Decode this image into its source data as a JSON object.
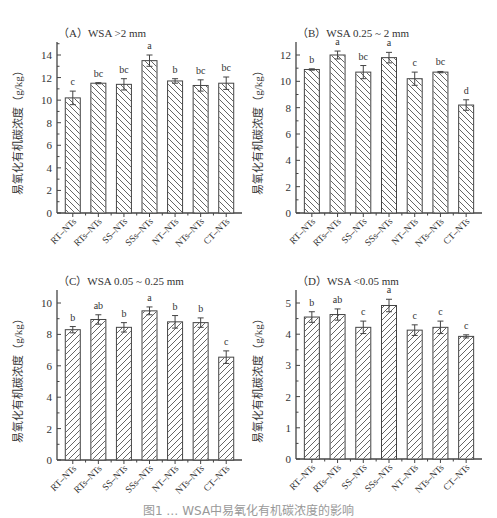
{
  "figure": {
    "caption": "图1 … WSA中易氧化有机碳浓度的影响"
  },
  "hatch_color": "#555555",
  "axis_color": "#444444",
  "chart_data": [
    {
      "id": "A",
      "type": "bar",
      "title": "（A）WSA >2 mm",
      "xlabel": "",
      "ylabel": "易氧化有机碳浓度（g/kg）",
      "categories": [
        "RT–NTs",
        "RTs–NTs",
        "SS–NTs",
        "SSs–NTs",
        "NT–NTs",
        "NTs–NTs",
        "CT–NTs"
      ],
      "values": [
        10.2,
        11.5,
        11.4,
        13.5,
        11.7,
        11.3,
        11.5
      ],
      "errors": [
        0.6,
        0.05,
        0.5,
        0.5,
        0.2,
        0.5,
        0.55
      ],
      "letters": [
        "c",
        "bc",
        "bc",
        "a",
        "b",
        "bc",
        "bc"
      ],
      "yticks": [
        0,
        2,
        4,
        6,
        8,
        10,
        12,
        14
      ],
      "ylim": [
        0,
        15
      ],
      "grid": false,
      "legend": null
    },
    {
      "id": "B",
      "type": "bar",
      "title": "（B）WSA 0.25 ~ 2 mm",
      "xlabel": "",
      "ylabel": "易氧化有机碳浓度（g/kg）",
      "categories": [
        "RT–NTs",
        "RTs–NTs",
        "SS–NTs",
        "SSs–NTs",
        "NT–NTs",
        "NTs–NTs",
        "CT–NTs"
      ],
      "values": [
        10.9,
        12.0,
        10.7,
        11.8,
        10.2,
        10.7,
        8.2
      ],
      "errors": [
        0.05,
        0.3,
        0.5,
        0.4,
        0.5,
        0.05,
        0.4
      ],
      "letters": [
        "b",
        "a",
        "bc",
        "a",
        "c",
        "bc",
        "d"
      ],
      "yticks": [
        0,
        2,
        4,
        6,
        8,
        10,
        12
      ],
      "ylim": [
        0,
        13
      ],
      "grid": false,
      "legend": null
    },
    {
      "id": "C",
      "type": "bar",
      "title": "（C）WSA 0.05 ~ 0.25 mm",
      "xlabel": "",
      "ylabel": "易氧化有机碳浓度（g/kg）",
      "categories": [
        "RT–NTs",
        "RTs–NTs",
        "SS–NTs",
        "SSs–NTs",
        "NT–NTs",
        "NTs–NTs",
        "CT–NTs"
      ],
      "values": [
        8.3,
        8.95,
        8.45,
        9.5,
        8.8,
        8.75,
        6.55
      ],
      "errors": [
        0.2,
        0.3,
        0.3,
        0.25,
        0.4,
        0.3,
        0.4
      ],
      "letters": [
        "b",
        "ab",
        "b",
        "a",
        "b",
        "b",
        "c"
      ],
      "yticks": [
        0,
        2,
        4,
        6,
        8,
        10
      ],
      "ylim": [
        0,
        11
      ],
      "grid": false,
      "legend": null
    },
    {
      "id": "D",
      "type": "bar",
      "title": "（D）WSA <0.05 mm",
      "xlabel": "",
      "ylabel": "易氧化有机碳浓度（g/kg）",
      "categories": [
        "RT–NTs",
        "RTs–NTs",
        "SS–NTs",
        "SSs–NTs",
        "NT–NTs",
        "NTs–NTs",
        "CT–NTs"
      ],
      "values": [
        4.55,
        4.63,
        4.22,
        4.92,
        4.13,
        4.22,
        3.93
      ],
      "errors": [
        0.17,
        0.18,
        0.2,
        0.2,
        0.17,
        0.2,
        0.05
      ],
      "letters": [
        "b",
        "ab",
        "c",
        "a",
        "c",
        "c",
        "c"
      ],
      "yticks": [
        0,
        1,
        2,
        3,
        4,
        5
      ],
      "ylim": [
        0,
        5.5
      ],
      "grid": false,
      "legend": null
    }
  ]
}
